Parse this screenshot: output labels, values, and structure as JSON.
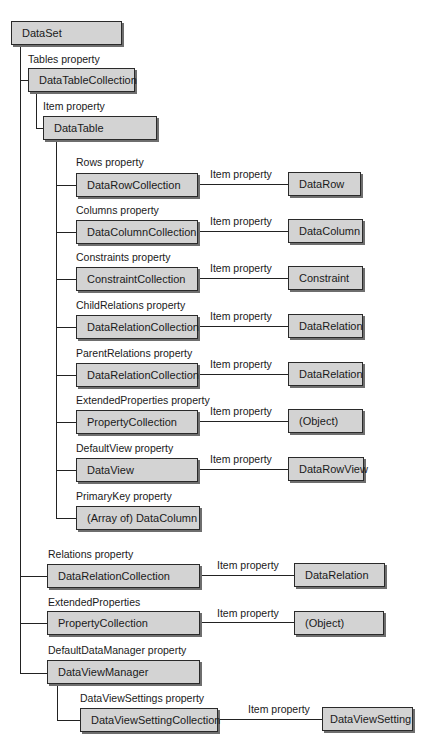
{
  "diagram": {
    "root": "DataSet",
    "nodes": {
      "dataset": "DataSet",
      "datatablecollection": "DataTableCollection",
      "datatable": "DataTable",
      "datarowcollection": "DataRowCollection",
      "datarow": "DataRow",
      "datacolumncollection": "DataColumnCollection",
      "datacolumn": "DataColumn",
      "constraintcollection": "ConstraintCollection",
      "constraint": "Constraint",
      "childrelations_collection": "DataRelationCollection",
      "childrelations_item": "DataRelation",
      "parentrelations_collection": "DataRelationCollection",
      "parentrelations_item": "DataRelation",
      "table_propertycollection": "PropertyCollection",
      "table_object": "(Object)",
      "dataview": "DataView",
      "datarowview": "DataRowView",
      "primarykey": "(Array of) DataColumn",
      "relations_collection": "DataRelationCollection",
      "relations_item": "DataRelation",
      "ds_propertycollection": "PropertyCollection",
      "ds_object": "(Object)",
      "dataviewmanager": "DataViewManager",
      "dataviewsettingcollection": "DataViewSettingCollection",
      "dataviewsetting": "DataViewSetting"
    },
    "labels": {
      "tables": "Tables property",
      "dtc_item": "Item property",
      "rows": "Rows property",
      "columns": "Columns property",
      "constraints": "Constraints property",
      "childrelations": "ChildRelations property",
      "parentrelations": "ParentRelations property",
      "extendedproperties_table": "ExtendedProperties property",
      "defaultview": "DefaultView property",
      "primarykey": "PrimaryKey property",
      "relations": "Relations property",
      "extendedproperties_ds": "ExtendedProperties",
      "defaultdatamanager": "DefaultDataManager property",
      "dataviewsettings": "DataViewSettings property",
      "item": "Item property"
    }
  }
}
